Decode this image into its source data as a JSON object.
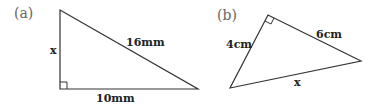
{
  "diagrams": [
    {
      "part_label": "(a)",
      "vertices": {
        "top": [
          60,
          10
        ],
        "right_angle": [
          60,
          89
        ],
        "right": [
          198,
          89
        ]
      },
      "right_angle_at": "bottom-left",
      "labels": {
        "vertical": "x",
        "hypotenuse": "16mm",
        "base": "10mm"
      }
    },
    {
      "part_label": "(b)",
      "vertices": {
        "right_angle": [
          268,
          15
        ],
        "left": [
          230,
          88
        ],
        "right": [
          361,
          61
        ]
      },
      "right_angle_at": "top",
      "labels": {
        "left_side": "4cm",
        "right_side": "6cm",
        "hypotenuse": "x"
      }
    }
  ],
  "colors": {
    "stroke": "#333333",
    "part_label": "#666666",
    "text": "#222222"
  }
}
